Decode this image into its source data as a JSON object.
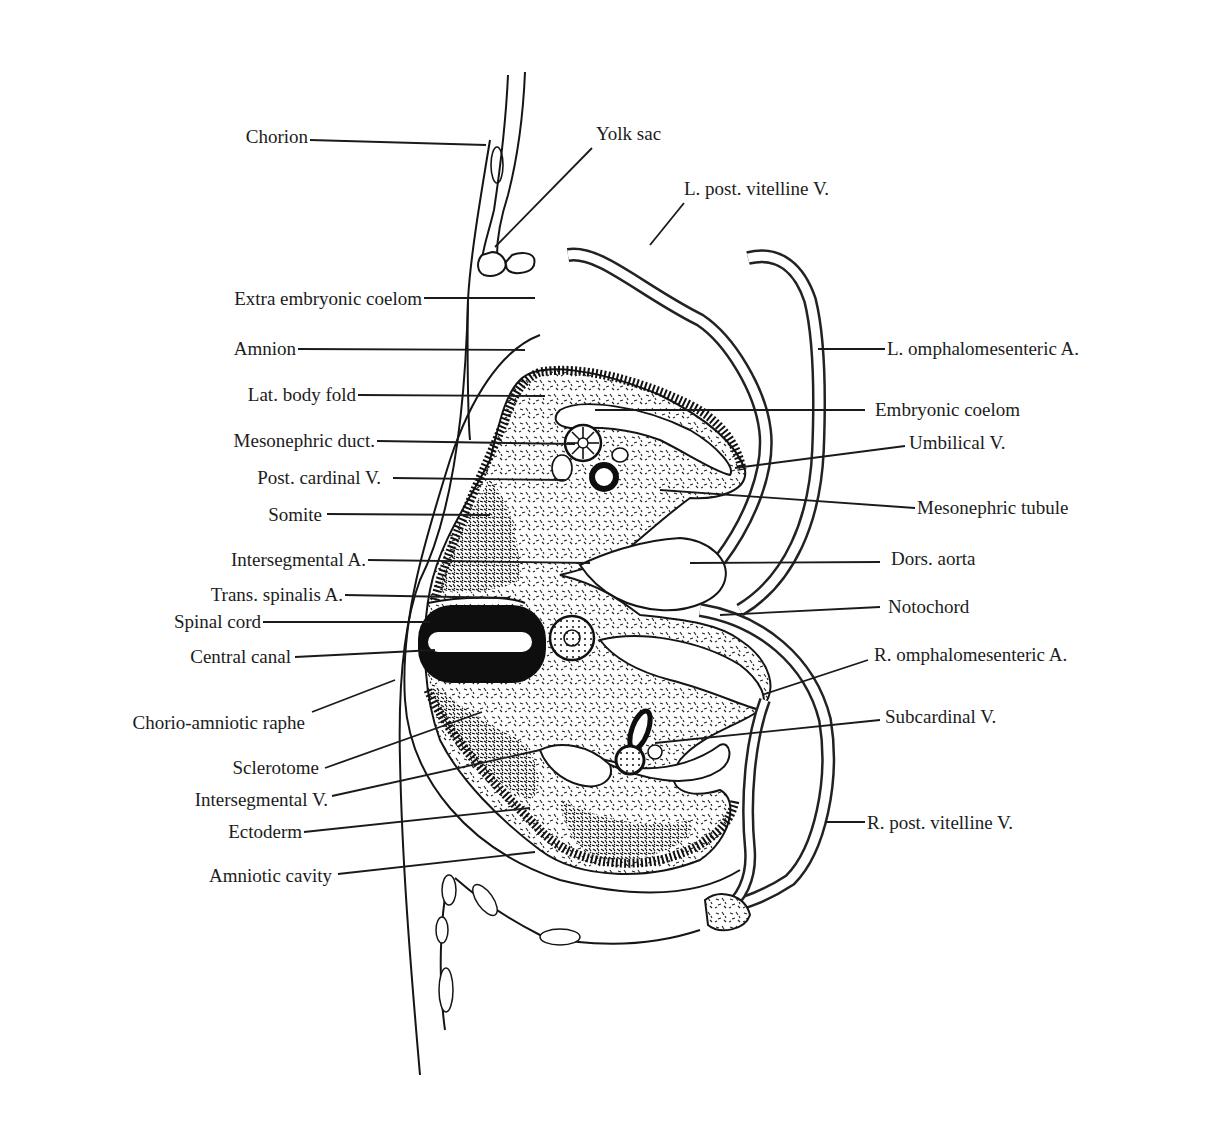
{
  "figure": {
    "labels_left": [
      {
        "id": "chorion",
        "text": "Chorion"
      },
      {
        "id": "extra-embryonic-coelom",
        "text": "Extra embryonic coelom"
      },
      {
        "id": "amnion",
        "text": "Amnion"
      },
      {
        "id": "lat-body-fold",
        "text": "Lat. body fold"
      },
      {
        "id": "mesonephric-duct",
        "text": "Mesonephric duct."
      },
      {
        "id": "post-cardinal-v",
        "text": "Post. cardinal V."
      },
      {
        "id": "somite",
        "text": "Somite"
      },
      {
        "id": "intersegmental-a",
        "text": "Intersegmental A."
      },
      {
        "id": "trans-spinalis-a",
        "text": "Trans. spinalis A."
      },
      {
        "id": "spinal-cord",
        "text": "Spinal cord"
      },
      {
        "id": "central-canal",
        "text": "Central canal"
      },
      {
        "id": "chorio-amniotic-raphe",
        "text": "Chorio-amniotic raphe"
      },
      {
        "id": "sclerotome",
        "text": "Sclerotome"
      },
      {
        "id": "intersegmental-v",
        "text": "Intersegmental V."
      },
      {
        "id": "ectoderm",
        "text": "Ectoderm"
      },
      {
        "id": "amniotic-cavity",
        "text": "Amniotic cavity"
      }
    ],
    "labels_right": [
      {
        "id": "yolk-sac",
        "text": "Yolk sac"
      },
      {
        "id": "l-post-vitelline-v",
        "text": "L. post. vitelline V."
      },
      {
        "id": "l-omphalomesenteric-a",
        "text": "L. omphalomesenteric A."
      },
      {
        "id": "embryonic-coelom",
        "text": "Embryonic coelom"
      },
      {
        "id": "umbilical-v",
        "text": "Umbilical V."
      },
      {
        "id": "mesonephric-tubule",
        "text": "Mesonephric tubule"
      },
      {
        "id": "dors-aorta",
        "text": "Dors. aorta"
      },
      {
        "id": "notochord",
        "text": "Notochord"
      },
      {
        "id": "r-omphalomesenteric-a",
        "text": "R. omphalomesenteric A."
      },
      {
        "id": "subcardinal-v",
        "text": "Subcardinal V."
      },
      {
        "id": "r-post-vitelline-v",
        "text": "R. post. vitelline V."
      }
    ]
  }
}
